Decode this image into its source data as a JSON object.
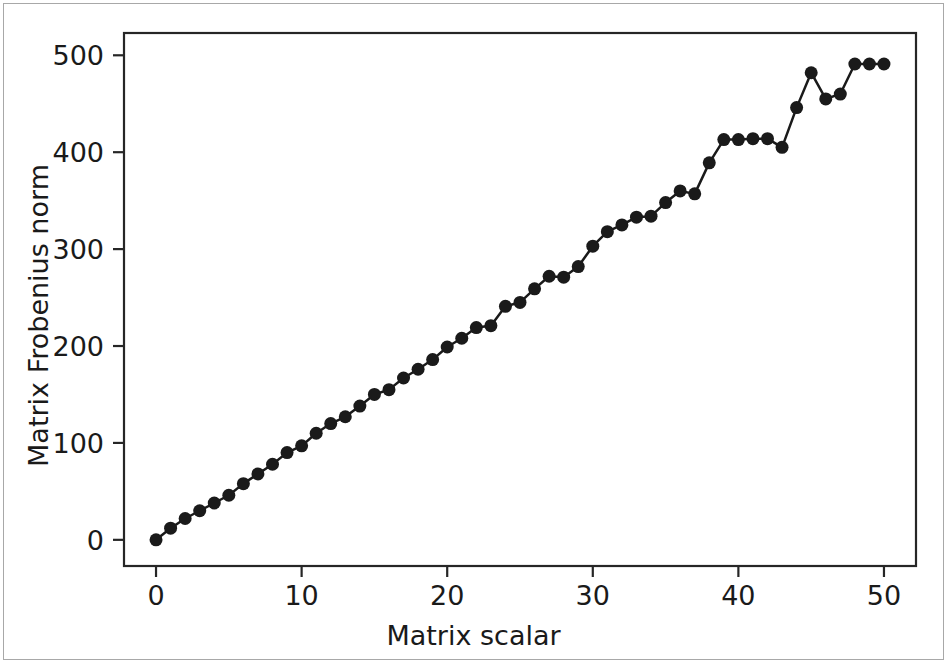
{
  "figure": {
    "background_color": "#ffffff",
    "border_color": "#a8a8a8",
    "axes_color": "#262626",
    "series_color": "#1a1a1a"
  },
  "chart_data": {
    "type": "line",
    "title": "",
    "xlabel": "Matrix scalar",
    "ylabel": "Matrix Frobenius norm",
    "xlim": [
      -2.2,
      52.2
    ],
    "ylim": [
      -27,
      523
    ],
    "xticks": [
      0,
      10,
      20,
      30,
      40,
      50
    ],
    "xtick_labels": [
      "0",
      "10",
      "20",
      "30",
      "40",
      "50"
    ],
    "yticks": [
      0,
      100,
      200,
      300,
      400,
      500
    ],
    "ytick_labels": [
      "0",
      "100",
      "200",
      "300",
      "400",
      "500"
    ],
    "grid": false,
    "legend": false,
    "marker": "o",
    "marker_size": 13,
    "line_width": 2.5,
    "series": [
      {
        "name": "Matrix Frobenius norm",
        "color": "#1a1a1a",
        "x": [
          0,
          1,
          2,
          3,
          4,
          5,
          6,
          7,
          8,
          9,
          10,
          11,
          12,
          13,
          14,
          15,
          16,
          17,
          18,
          19,
          20,
          21,
          22,
          23,
          24,
          25,
          26,
          27,
          28,
          29,
          30,
          31,
          32,
          33,
          34,
          35,
          36,
          37,
          38,
          39,
          40,
          41,
          42,
          43,
          44,
          45,
          46,
          47,
          48,
          49,
          50
        ],
        "y": [
          0,
          12,
          22,
          30,
          38,
          46,
          58,
          68,
          78,
          90,
          97,
          110,
          120,
          127,
          138,
          150,
          155,
          167,
          176,
          186,
          199,
          208,
          219,
          221,
          241,
          245,
          259,
          272,
          271,
          282,
          303,
          318,
          325,
          333,
          334,
          348,
          360,
          357,
          389,
          413,
          413,
          414,
          414,
          405,
          446,
          482,
          455,
          460,
          491,
          491,
          491
        ]
      }
    ]
  },
  "axis_label_x": "Matrix scalar",
  "axis_label_y": "Matrix Frobenius norm"
}
